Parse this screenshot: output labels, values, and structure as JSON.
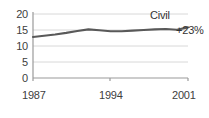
{
  "chart_data": {
    "type": "line",
    "title": "",
    "subtitle": "",
    "xlabel": "",
    "ylabel": "",
    "xlim": [
      1987,
      2001
    ],
    "ylim": [
      0,
      20
    ],
    "grid": true,
    "legend_position": "inline-end",
    "y_ticks": [
      "20",
      "15",
      "10",
      "5",
      "0"
    ],
    "y_tick_values": [
      20,
      15,
      10,
      5,
      0
    ],
    "x_ticks": [
      "1987",
      "1994",
      "2001"
    ],
    "x_tick_values": [
      1987,
      1994,
      2001
    ],
    "series": [
      {
        "name": "Civil",
        "color": "#595959",
        "x": [
          1987,
          1988,
          1989,
          1990,
          1991,
          1992,
          1993,
          1994,
          1995,
          1996,
          1997,
          1998,
          1999,
          2000,
          2001
        ],
        "values": [
          12.8,
          13.2,
          13.6,
          14.1,
          14.7,
          15.2,
          14.9,
          14.6,
          14.6,
          14.8,
          15.0,
          15.2,
          15.3,
          15.1,
          15.8
        ]
      }
    ],
    "annotations": [
      {
        "text": "Civil",
        "kind": "series-label"
      },
      {
        "text": "+23%",
        "kind": "change-callout"
      }
    ]
  },
  "labels": {
    "series_label": "Civil",
    "change_callout": "+23%"
  },
  "colors": {
    "line": "#595959",
    "axis": "#9a9a9a",
    "grid": "#d8d8d8",
    "text": "#404040",
    "background": "#ffffff"
  }
}
